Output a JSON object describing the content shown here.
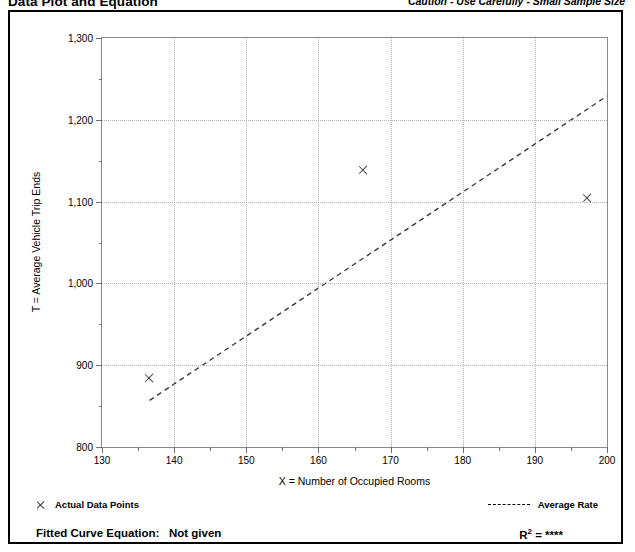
{
  "header": {
    "title": "Data Plot and Equation",
    "caution": "Caution - Use Carefully - Small Sample Size"
  },
  "legend": {
    "points_marker": "x-marker-icon",
    "points_label": "Actual Data Points",
    "rate_marker": "dashed-line-icon",
    "rate_label": "Average Rate"
  },
  "footer": {
    "fitted_label": "Fitted Curve Equation:",
    "fitted_value": "Not given",
    "r_squared_label": "R",
    "r_squared_exponent": "2",
    "r_squared_equals": "=",
    "r_squared_value": "****"
  },
  "chart_data": {
    "type": "scatter",
    "title": "Data Plot and Equation",
    "subtitle": "Caution - Use Carefully - Small Sample Size",
    "xlabel": "X = Number of Occupied Rooms",
    "ylabel": "T = Average Vehicle Trip Ends",
    "xlim": [
      130,
      200
    ],
    "ylim": [
      800,
      1300
    ],
    "x_major_ticks": [
      130,
      140,
      150,
      160,
      170,
      180,
      190,
      200
    ],
    "x_minor_ticks": [
      135,
      145,
      155,
      165,
      175,
      185,
      195
    ],
    "y_major_ticks": [
      800,
      900,
      1000,
      1100,
      1200,
      1300
    ],
    "y_minor_ticks": [
      850,
      950,
      1050,
      1150,
      1250
    ],
    "x_tick_labels": [
      "130",
      "140",
      "150",
      "160",
      "170",
      "180",
      "190",
      "200"
    ],
    "y_tick_labels": [
      "800",
      "900",
      "1,000",
      "1,100",
      "1,200",
      "1,300"
    ],
    "grid": true,
    "legend_position": "below-plot",
    "series": [
      {
        "name": "Actual Data Points",
        "type": "scatter",
        "marker": "x",
        "points": [
          {
            "x": 136.6,
            "y": 884
          },
          {
            "x": 166.2,
            "y": 1139
          },
          {
            "x": 197.2,
            "y": 1105
          }
        ]
      },
      {
        "name": "Average Rate",
        "type": "line",
        "style": "dashed",
        "endpoints": [
          {
            "x": 136.6,
            "y": 857
          },
          {
            "x": 200.0,
            "y": 1229
          }
        ]
      }
    ],
    "annotations": {
      "fitted_curve_equation": "Not given",
      "r_squared": "****"
    }
  },
  "colors": {
    "frame": "#000000",
    "axis": "#8a8a8a",
    "grid": "#b4b4b4",
    "marker": "#404040",
    "trendline": "#3a3a3a"
  }
}
